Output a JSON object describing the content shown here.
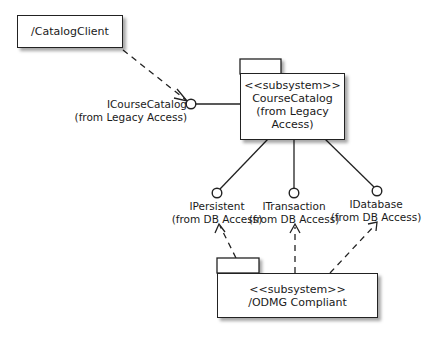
{
  "diagram": {
    "type": "UML component/subsystem diagram",
    "nodes": {
      "catalog_client": {
        "label": "/CatalogClient"
      },
      "course_catalog": {
        "stereotype": "<<subsystem>>",
        "name": "CourseCatalog",
        "origin": "(from Legacy Access)"
      },
      "odmg": {
        "stereotype": "<<subsystem>>",
        "name": "/ODMG Compliant"
      }
    },
    "interfaces": {
      "icoursecatalog": {
        "name": "ICourseCatalog",
        "origin": "(from Legacy Access)"
      },
      "ipersistent": {
        "name": "IPersistent",
        "origin": "(from DB Access)"
      },
      "itransaction": {
        "name": "ITransaction",
        "origin": "(from DB Access)"
      },
      "idatabase": {
        "name": "IDatabase",
        "origin": "(from DB Access)"
      }
    },
    "edges": [
      {
        "from": "/CatalogClient",
        "to": "ICourseCatalog",
        "kind": "dependency (dashed, open arrow)"
      },
      {
        "from": "CourseCatalog",
        "to": "ICourseCatalog",
        "kind": "realization (lollipop)"
      },
      {
        "from": "CourseCatalog",
        "to": "IPersistent",
        "kind": "realization (lollipop)"
      },
      {
        "from": "CourseCatalog",
        "to": "ITransaction",
        "kind": "realization (lollipop)"
      },
      {
        "from": "CourseCatalog",
        "to": "IDatabase",
        "kind": "realization (lollipop)"
      },
      {
        "from": "/ODMG Compliant",
        "to": "IPersistent",
        "kind": "dependency (dashed, open arrow)"
      },
      {
        "from": "/ODMG Compliant",
        "to": "ITransaction",
        "kind": "dependency (dashed, open arrow)"
      },
      {
        "from": "/ODMG Compliant",
        "to": "IDatabase",
        "kind": "dependency (dashed, open arrow)"
      }
    ]
  },
  "colors": {
    "line": "#222222",
    "background": "#ffffff"
  }
}
